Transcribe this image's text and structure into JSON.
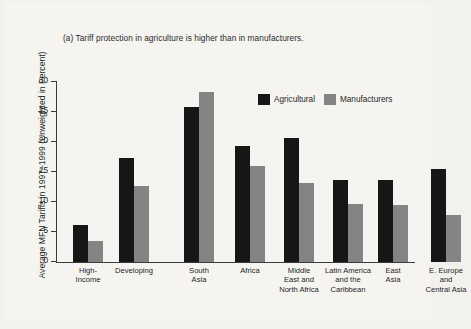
{
  "chart_data": {
    "type": "bar",
    "title": "(a) Tariff protection in agriculture is higher than in manufacturers.",
    "xlabel": "",
    "ylabel": "Average MFN Tariffs in 1997–1999 (Unweighted in Percent)",
    "ylim": [
      0,
      30
    ],
    "yticks": [
      0,
      5,
      10,
      15,
      20,
      25,
      30
    ],
    "ytick_labels": [
      "0",
      "5",
      "10",
      "15",
      "20",
      "25",
      "30"
    ],
    "grid": false,
    "legend_position": "top-right",
    "categories": [
      "High-\nIncome",
      "Developing",
      "South\nAsia",
      "Africa",
      "Middle\nEast and\nNorth Africa",
      "Latin America\nand the\nCaribbean",
      "East\nAsia",
      "E. Europe\nand\nCentral Asia"
    ],
    "series": [
      {
        "name": "Agricultural",
        "color": "#161616",
        "values": [
          6.2,
          17.4,
          25.8,
          19.3,
          20.7,
          13.6,
          13.6,
          15.5
        ]
      },
      {
        "name": "Manufacturers",
        "color": "#848484",
        "values": [
          3.5,
          12.6,
          28.4,
          16.0,
          13.2,
          9.6,
          9.5,
          7.8
        ]
      }
    ]
  },
  "colors": {
    "background": "#f2f1ee",
    "paper": "#f5f4f1",
    "axis": "#3a3a3a",
    "text": "#1f1f1f",
    "agricultural": "#161616",
    "manufacturers": "#848484"
  }
}
